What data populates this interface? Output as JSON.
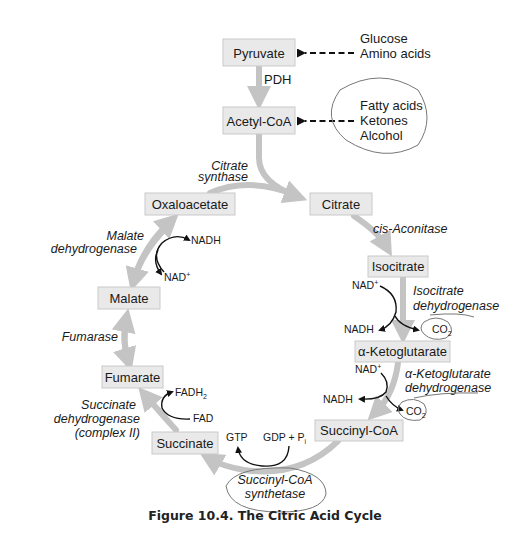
{
  "figure": {
    "caption": "Figure 10.4.  The Citric Acid Cycle"
  },
  "metabolites": {
    "pyruvate": "Pyruvate",
    "acetyl_coa": "Acetyl-CoA",
    "citrate": "Citrate",
    "isocitrate": "Isocitrate",
    "alpha_ketoglutarate": "α-Ketoglutarate",
    "succinyl_coa": "Succinyl-CoA",
    "succinate": "Succinate",
    "fumarate": "Fumarate",
    "malate": "Malate",
    "oxaloacetate": "Oxaloacetate"
  },
  "sources": {
    "pyruvate_sources": [
      "Glucose",
      "Amino acids"
    ],
    "acetyl_coa_sources": [
      "Fatty acids",
      "Ketones",
      "Alcohol"
    ]
  },
  "enzymes": {
    "pdh": "PDH",
    "citrate_synthase": [
      "Citrate",
      "synthase"
    ],
    "cis_aconitase": "cis-Aconitase",
    "isocitrate_dh": [
      "Isocitrate",
      "dehydrogenase"
    ],
    "akg_dh": [
      "α-Ketoglutarate",
      "dehydrogenase"
    ],
    "succinyl_coa_synthetase": [
      "Succinyl-CoA",
      "synthetase"
    ],
    "succinate_dh": [
      "Succinate",
      "dehydrogenase",
      "(complex II)"
    ],
    "fumarase": "Fumarase",
    "malate_dh": [
      "Malate",
      "dehydrogenase"
    ]
  },
  "cofactors": {
    "isocitrate_dh": {
      "in": "NAD",
      "in_sup": "+",
      "out": "NADH",
      "released": "CO",
      "released_sub": "2"
    },
    "akg_dh": {
      "in": "NAD",
      "in_sup": "+",
      "out": "NADH",
      "released": "CO",
      "released_sub": "2"
    },
    "succinyl_coa_synthetase": {
      "in": "GDP + P",
      "in_sub": "i",
      "out": "GTP"
    },
    "succinate_dh": {
      "in": "FAD",
      "out": "FADH",
      "out_sub": "2"
    },
    "malate_dh": {
      "in": "NAD",
      "in_sup": "+",
      "out": "NADH"
    }
  },
  "colors": {
    "box_fill": "#e9e9e9",
    "flow_arrow": "#c4c4c4",
    "ink": "#111111"
  }
}
